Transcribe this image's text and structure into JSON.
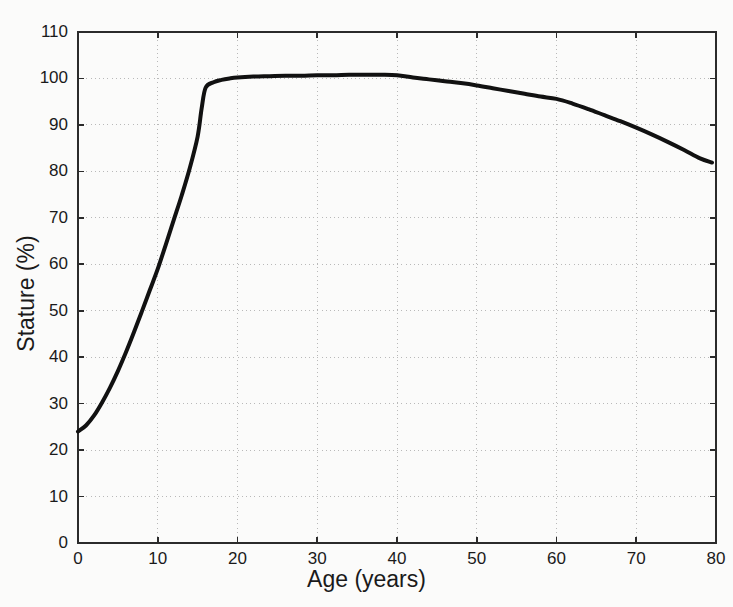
{
  "figure": {
    "background_color": "#fbfbfa",
    "axis_color": "#2b2b2b",
    "grid_color": "#b9b9b9",
    "line_color": "#111111"
  },
  "chart_data": {
    "type": "line",
    "title": "",
    "xlabel": "Age (years)",
    "ylabel": "Stature (%)",
    "xlim": [
      0,
      80
    ],
    "ylim": [
      0,
      110
    ],
    "xticks": [
      0,
      10,
      20,
      30,
      40,
      50,
      60,
      70,
      80
    ],
    "yticks": [
      0,
      10,
      20,
      30,
      40,
      50,
      60,
      70,
      80,
      90,
      100,
      110
    ],
    "xtick_labels": [
      "0",
      "10",
      "20",
      "30",
      "40",
      "50",
      "60",
      "70",
      "80"
    ],
    "ytick_labels": [
      "0",
      "10",
      "20",
      "30",
      "40",
      "50",
      "60",
      "70",
      "80",
      "90",
      "100",
      "110"
    ],
    "grid": true,
    "grid_style": "dotted",
    "legend": null,
    "series": [
      {
        "name": "Stature",
        "color": "#111111",
        "line_width": 4,
        "x": [
          0,
          1,
          2,
          3,
          4,
          5,
          6,
          7,
          8,
          9,
          10,
          11,
          12,
          13,
          14,
          15,
          15.5,
          16,
          17,
          18,
          19,
          20,
          22,
          24,
          26,
          28,
          30,
          32,
          34,
          36,
          38,
          40,
          42,
          44,
          46,
          48,
          50,
          52,
          54,
          56,
          58,
          60,
          62,
          64,
          66,
          68,
          70,
          72,
          74,
          76,
          78,
          79.5
        ],
        "y": [
          24.0,
          25.3,
          27.4,
          30.2,
          33.4,
          37.0,
          41.0,
          45.3,
          49.8,
          54.4,
          59.0,
          64.2,
          69.5,
          74.8,
          80.6,
          87.5,
          93.5,
          98.0,
          99.2,
          99.7,
          100.0,
          100.2,
          100.4,
          100.5,
          100.6,
          100.6,
          100.7,
          100.7,
          100.8,
          100.8,
          100.8,
          100.7,
          100.2,
          99.8,
          99.4,
          99.0,
          98.5,
          97.9,
          97.3,
          96.7,
          96.1,
          95.6,
          94.6,
          93.4,
          92.1,
          90.8,
          89.4,
          87.9,
          86.3,
          84.6,
          82.8,
          81.9
        ]
      }
    ]
  },
  "axis_titles": {
    "x": "Age (years)",
    "y": "Stature (%)"
  }
}
